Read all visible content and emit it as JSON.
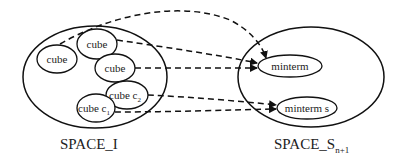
{
  "diagram": {
    "left_space": {
      "label": "SPACE_I",
      "cubes": [
        {
          "label": "cube"
        },
        {
          "label": "cube"
        },
        {
          "label": "cube"
        },
        {
          "label": "cube c",
          "subscript": "2"
        },
        {
          "label": "cube c",
          "subscript": "1"
        }
      ]
    },
    "right_space": {
      "label": "SPACE_S",
      "label_subscript": "n+1",
      "minterms": [
        {
          "label": "minterm"
        },
        {
          "label": "minterm s"
        }
      ]
    },
    "arrows": [
      {
        "from": "cube (left)",
        "to": "minterm",
        "style": "dashed"
      },
      {
        "from": "cube (top)",
        "to": "minterm",
        "style": "dashed"
      },
      {
        "from": "cube (middle)",
        "to": "minterm",
        "style": "dashed"
      },
      {
        "from": "cube c2",
        "to": "minterm s",
        "style": "dashed"
      },
      {
        "from": "cube c1",
        "to": "minterm s",
        "style": "dashed"
      }
    ],
    "colors": {
      "stroke": "#111111",
      "background": "#ffffff"
    }
  }
}
